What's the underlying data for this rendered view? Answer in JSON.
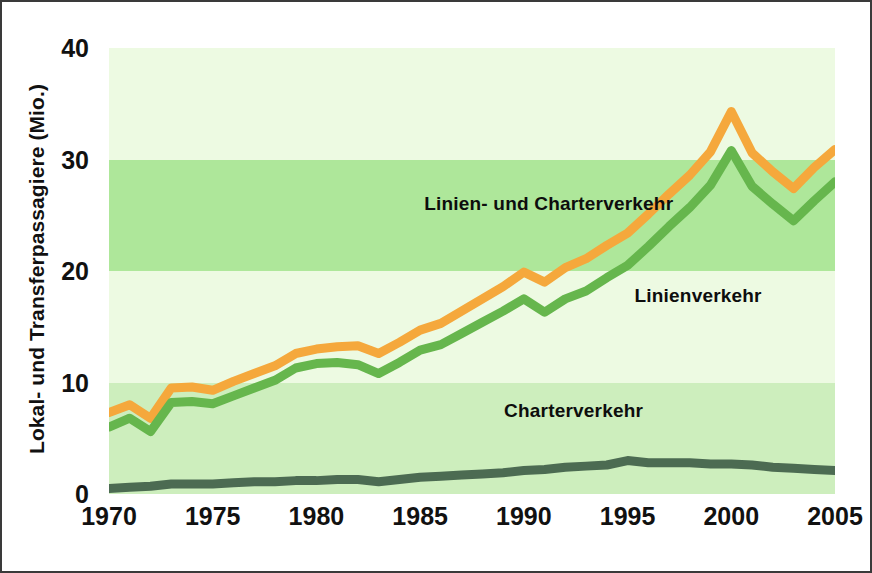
{
  "chart_data": {
    "type": "line",
    "title": "",
    "subtitle": "",
    "xlabel": "",
    "ylabel": "Lokal- und Transferpassagiere (Mio.)",
    "xlim": [
      1970,
      2005
    ],
    "ylim": [
      0,
      40
    ],
    "grid": false,
    "legend_position": "inline-annotations",
    "xticks": [
      "1970",
      "1975",
      "1980",
      "1985",
      "1990",
      "1995",
      "2000",
      "2005"
    ],
    "yticks": [
      "0",
      "10",
      "20",
      "30",
      "40"
    ],
    "x": [
      1970,
      1971,
      1972,
      1973,
      1974,
      1975,
      1976,
      1977,
      1978,
      1979,
      1980,
      1981,
      1982,
      1983,
      1984,
      1985,
      1986,
      1987,
      1988,
      1989,
      1990,
      1991,
      1992,
      1993,
      1994,
      1995,
      1996,
      1997,
      1998,
      1999,
      2000,
      2001,
      2002,
      2003,
      2004,
      2005
    ],
    "series": [
      {
        "name": "Linien- und Charterverkehr",
        "color": "#F5A83C",
        "values": [
          7.3,
          8.0,
          6.8,
          9.5,
          9.6,
          9.3,
          10.1,
          10.8,
          11.5,
          12.6,
          13.0,
          13.2,
          13.3,
          12.6,
          13.6,
          14.7,
          15.3,
          16.4,
          17.5,
          18.6,
          19.9,
          19.0,
          20.3,
          21.1,
          22.3,
          23.4,
          25.1,
          26.9,
          28.6,
          30.7,
          34.3,
          30.6,
          28.9,
          27.4,
          29.3,
          30.9
        ]
      },
      {
        "name": "Linienverkehr",
        "color": "#66B64D",
        "values": [
          6.0,
          6.8,
          5.6,
          8.2,
          8.3,
          8.1,
          8.8,
          9.5,
          10.2,
          11.3,
          11.7,
          11.8,
          11.6,
          10.8,
          11.8,
          12.9,
          13.4,
          14.4,
          15.4,
          16.4,
          17.5,
          16.3,
          17.5,
          18.2,
          19.4,
          20.5,
          22.2,
          24.0,
          25.7,
          27.7,
          30.8,
          27.6,
          26.0,
          24.5,
          26.3,
          28.0
        ]
      },
      {
        "name": "Charterverkehr",
        "color": "#4C6B52",
        "values": [
          0.5,
          0.6,
          0.7,
          0.9,
          0.9,
          0.9,
          1.0,
          1.1,
          1.1,
          1.2,
          1.2,
          1.3,
          1.3,
          1.1,
          1.3,
          1.5,
          1.6,
          1.7,
          1.8,
          1.9,
          2.1,
          2.2,
          2.4,
          2.5,
          2.6,
          3.0,
          2.8,
          2.8,
          2.8,
          2.7,
          2.7,
          2.6,
          2.4,
          2.3,
          2.2,
          2.1
        ]
      }
    ],
    "annotations": [
      {
        "text": "Linien- und Charterverkehr",
        "x": 1991.2,
        "y": 26.0
      },
      {
        "text": "Linienverkehr",
        "x": 1998.4,
        "y": 17.8
      },
      {
        "text": "Charterverkehr",
        "x": 1992.4,
        "y": 7.4
      }
    ],
    "bands": [
      {
        "from": 0,
        "to": 10,
        "color": "#CDEEBD"
      },
      {
        "from": 10,
        "to": 20,
        "color": "#EDFAE2"
      },
      {
        "from": 20,
        "to": 30,
        "color": "#AEE79A"
      },
      {
        "from": 30,
        "to": 40,
        "color": "#EDFAE2"
      }
    ],
    "background": "#ffffff",
    "frame_color": "#3a3a3a"
  }
}
